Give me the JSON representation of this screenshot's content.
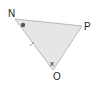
{
  "diagram": {
    "type": "triangle",
    "vertices": [
      {
        "label": "N",
        "x": 15,
        "y": 19,
        "label_x": 8,
        "label_y": 17
      },
      {
        "label": "P",
        "x": 82,
        "y": 26,
        "label_x": 84,
        "label_y": 30
      },
      {
        "label": "O",
        "x": 53,
        "y": 70,
        "label_x": 53,
        "label_y": 80
      }
    ],
    "angle_marks": {
      "N": {
        "type": "dot",
        "x": 23,
        "y": 25
      },
      "O": {
        "type": "text",
        "text": "x",
        "x": 50,
        "y": 65
      }
    },
    "side_marks": [
      {
        "side": "NO",
        "type": "tick",
        "x": 32,
        "y": 44
      }
    ],
    "colors": {
      "fill": "#e6e6e6",
      "stroke": "#b8b8b8",
      "dot": "#555555",
      "text": "#222222"
    }
  }
}
